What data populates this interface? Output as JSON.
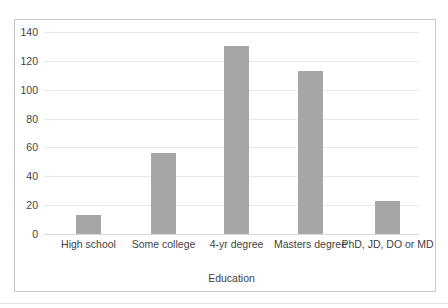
{
  "chart_data": {
    "type": "bar",
    "title": "",
    "xlabel": "Education",
    "ylabel": "",
    "categories": [
      "High school",
      "Some college",
      "4-yr degree",
      "Masters degree",
      "PhD, JD, DO or MD"
    ],
    "values": [
      13,
      56,
      130,
      113,
      23
    ],
    "ylim": [
      0,
      140
    ],
    "yticks": [
      0,
      20,
      40,
      60,
      80,
      100,
      120,
      140
    ],
    "ytick_labels": [
      "0",
      "20",
      "40",
      "60",
      "80",
      "100",
      "120",
      "140"
    ],
    "grid": "horizontal",
    "legend": "none",
    "bar_color": "#a6a6a6",
    "gridline_color": "#e8e8e8",
    "border_color": "#c8c8c8",
    "text_color": "#3f3f3f",
    "background": "#ffffff"
  }
}
